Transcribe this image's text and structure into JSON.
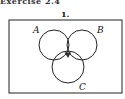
{
  "heading": "Exercise 2.4",
  "problem_number": "1.",
  "diagram": {
    "type": "venn",
    "sets": [
      "A",
      "B",
      "C"
    ],
    "shaded_region": "A ∩ B ∩ C",
    "labels": {
      "A": "A",
      "B": "B",
      "C": "C"
    },
    "colors": {
      "stroke": "#222222",
      "shade": "#333333",
      "background": "#ffffff"
    }
  }
}
